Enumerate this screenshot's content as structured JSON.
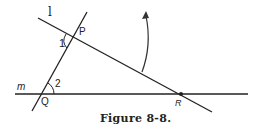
{
  "figure": {
    "caption": "Figure 8-8.",
    "labels": {
      "line_l": "l",
      "line_m": "m",
      "point_p": "P",
      "point_q": "Q",
      "point_r": "R",
      "angle_1": "1",
      "angle_2": "2"
    },
    "colors": {
      "stroke": "#222222",
      "background": "#ffffff"
    }
  }
}
